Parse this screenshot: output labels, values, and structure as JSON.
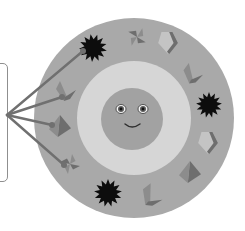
{
  "diagram": {
    "callout_box": {
      "text": ""
    },
    "colors": {
      "background": "#ffffff",
      "outer_ring": "#a9a9a9",
      "inner_ring": "#d6d6d6",
      "face": "#a2a2a2",
      "star": "#0d0d0d",
      "shape_dark": "#6e6e6e",
      "shape_mid": "#8c8c8c",
      "shape_light": "#c4c4c4",
      "connector_line": "#707070",
      "box_border": "#8f8f8f"
    },
    "face": {
      "expression": "smile",
      "eyes": 2
    },
    "ring_items": [
      {
        "kind": "spiky-star"
      },
      {
        "kind": "pinwheel"
      },
      {
        "kind": "chevron-tile"
      },
      {
        "kind": "folded-paper"
      },
      {
        "kind": "spiky-star"
      },
      {
        "kind": "chevron-tile"
      },
      {
        "kind": "pyramid"
      },
      {
        "kind": "folded-paper"
      },
      {
        "kind": "spiky-star"
      },
      {
        "kind": "pinwheel"
      },
      {
        "kind": "pyramid"
      },
      {
        "kind": "folded-paper"
      }
    ],
    "connections": {
      "from": "callout_box",
      "to_item_indices": [
        0,
        11,
        10,
        9
      ]
    }
  }
}
